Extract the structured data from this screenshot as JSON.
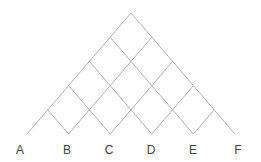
{
  "diagram": {
    "type": "lattice-triangle",
    "labels": [
      {
        "text": "A",
        "x": 20,
        "y": 144
      },
      {
        "text": "B",
        "x": 67,
        "y": 144
      },
      {
        "text": "C",
        "x": 109,
        "y": 144
      },
      {
        "text": "D",
        "x": 151,
        "y": 144
      },
      {
        "text": "E",
        "x": 193,
        "y": 144
      },
      {
        "text": "F",
        "x": 238,
        "y": 144
      }
    ],
    "line_color": "#b0b0b0",
    "label_color": "#444444"
  }
}
